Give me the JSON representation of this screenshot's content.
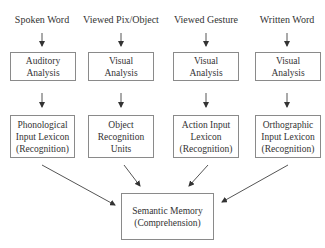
{
  "inputs": [
    {
      "label": "Spoken Word"
    },
    {
      "label": "Viewed Pix/Object"
    },
    {
      "label": "Viewed Gesture"
    },
    {
      "label": "Written Word"
    }
  ],
  "analysis_boxes": [
    {
      "label": "Auditory\nAnalysis"
    },
    {
      "label": "Visual\nAnalysis"
    },
    {
      "label": "Visual\nAnalysis"
    },
    {
      "label": "Visual\nAnalysis"
    }
  ],
  "recognition_boxes": [
    {
      "label": "Phonological\nInput Lexicon\n(Recognition)"
    },
    {
      "label": "Object\nRecognition\nUnits"
    },
    {
      "label": "Action Input\nLexicon\n(Recognition)"
    },
    {
      "label": "Orthographic\nInput Lexicon\n(Recognition)"
    }
  ],
  "output_box": {
    "label": "Semantic Memory\n(Comprehension)"
  },
  "colors": {
    "line": "#555555",
    "border": "#8a8a8a",
    "text": "#333333"
  }
}
